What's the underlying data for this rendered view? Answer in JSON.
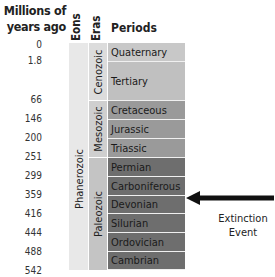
{
  "header": {
    "years_label": "Millions of years ago",
    "eons_label": "Eons",
    "eras_label": "Eras",
    "periods_label": "Periods"
  },
  "ticks": [
    "0",
    "1.8",
    "66",
    "146",
    "200",
    "251",
    "299",
    "359",
    "416",
    "444",
    "488",
    "542"
  ],
  "eons": [
    {
      "label": "Phanerozoic",
      "color": "#e8e8e8"
    }
  ],
  "eras": [
    {
      "label": "Cenozoic",
      "color": "#dcdcdc"
    },
    {
      "label": "Mesozoic",
      "color": "#cfcfcf"
    },
    {
      "label": "Paleozoic",
      "color": "#c4c4c4"
    }
  ],
  "periods": [
    {
      "label": "Quaternary",
      "color": "#c8c8c8"
    },
    {
      "label": "Tertiary",
      "color": "#c0c0c0"
    },
    {
      "label": "Cretaceous",
      "color": "#9a9a9a"
    },
    {
      "label": "Jurassic",
      "color": "#9a9a9a"
    },
    {
      "label": "Triassic",
      "color": "#9a9a9a"
    },
    {
      "label": "Permian",
      "color": "#6e6e6e"
    },
    {
      "label": "Carboniferous",
      "color": "#6e6e6e"
    },
    {
      "label": "Devonian",
      "color": "#6e6e6e"
    },
    {
      "label": "Silurian",
      "color": "#6e6e6e"
    },
    {
      "label": "Ordovician",
      "color": "#6e6e6e"
    },
    {
      "label": "Cambrian",
      "color": "#6e6e6e"
    }
  ],
  "annotation": {
    "label_line1": "Extinction",
    "label_line2": "Event",
    "points_to": "Carboniferous / Devonian boundary"
  }
}
